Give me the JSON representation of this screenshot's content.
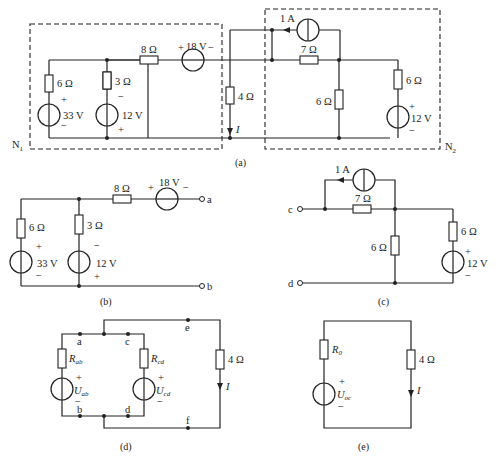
{
  "figure": {
    "captions": {
      "a": "(a)",
      "b": "(b)",
      "c": "(c)",
      "d": "(d)",
      "e": "(e)"
    },
    "network_labels": {
      "n1": "N",
      "n1_sub": "1",
      "n2": "N",
      "n2_sub": "2"
    },
    "current_label": "I"
  },
  "fig_a": {
    "r_6_left": "6 Ω",
    "r_3": "3 Ω",
    "r_8": "8 Ω",
    "v_18": "18 V",
    "v_33": "33 V",
    "v_12_left": "12 V",
    "r_4": "4 Ω",
    "i_1a": "1 A",
    "r_7": "7 Ω",
    "r_6_mid": "6 Ω",
    "r_6_right": "6 Ω",
    "v_12_right": "12 V",
    "plus": "+",
    "minus": "−"
  },
  "fig_b": {
    "r_6": "6 Ω",
    "r_3": "3 Ω",
    "r_8": "8 Ω",
    "v_18": "18 V",
    "v_33": "33 V",
    "v_12": "12 V",
    "terminal_a": "a",
    "terminal_b": "b"
  },
  "fig_c": {
    "i_1a": "1 A",
    "r_7": "7 Ω",
    "r_6_mid": "6 Ω",
    "r_6_right": "6 Ω",
    "v_12": "12 V",
    "terminal_c": "c",
    "terminal_d": "d"
  },
  "fig_d": {
    "r_ab": "R",
    "r_ab_sub": "ab",
    "u_ab": "U",
    "u_ab_sub": "ab",
    "r_cd": "R",
    "r_cd_sub": "cd",
    "u_cd": "U",
    "u_cd_sub": "cd",
    "r_4": "4 Ω",
    "nodes": {
      "a": "a",
      "b": "b",
      "c": "c",
      "d": "d",
      "e": "e",
      "f": "f"
    }
  },
  "fig_e": {
    "r_0": "R",
    "r_0_sub": "0",
    "u_oc": "U",
    "u_oc_sub": "oc",
    "r_4": "4 Ω"
  }
}
